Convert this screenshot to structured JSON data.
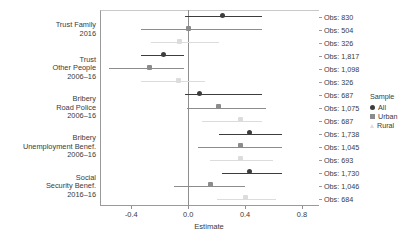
{
  "chart_data": {
    "type": "scatter",
    "title": "",
    "xlabel": "Estimate",
    "ylabel": "",
    "xlim": [
      -0.62,
      0.92
    ],
    "xticks": [
      -0.4,
      0.0,
      0.4,
      0.8
    ],
    "xticklabels": [
      "-0.4",
      "0.0",
      "0.4",
      "0.8"
    ],
    "grid": false,
    "reference_line": 0.0,
    "legend": {
      "title": "Sample",
      "position": "right",
      "entries": [
        {
          "name": "All",
          "color": "#3d3d3d",
          "marker": "circle"
        },
        {
          "name": "Urban",
          "color": "#8c8c8c",
          "marker": "square"
        },
        {
          "name": "Rural",
          "color": "#dcdcdc",
          "marker": "triangle"
        }
      ]
    },
    "obs_label_prefix": "Obs: ",
    "groups": [
      {
        "label": "Trust Family\n2016",
        "rows": [
          {
            "sample": "All",
            "estimate": 0.24,
            "low": -0.02,
            "high": 0.52,
            "obs": "830"
          },
          {
            "sample": "Urban",
            "estimate": 0.0,
            "low": -0.33,
            "high": 0.52,
            "obs": "504"
          },
          {
            "sample": "Rural",
            "estimate": -0.06,
            "low": -0.26,
            "high": 0.22,
            "obs": "326"
          }
        ]
      },
      {
        "label": "Trust\nOther People\n2006–16",
        "rows": [
          {
            "sample": "All",
            "estimate": -0.17,
            "low": -0.33,
            "high": -0.03,
            "obs": "1,817"
          },
          {
            "sample": "Urban",
            "estimate": -0.27,
            "low": -0.56,
            "high": -0.03,
            "obs": "1,098"
          },
          {
            "sample": "Rural",
            "estimate": -0.07,
            "low": -0.33,
            "high": 0.12,
            "obs": "326"
          }
        ]
      },
      {
        "label": "Bribery\nRoad Police\n2006–16",
        "rows": [
          {
            "sample": "All",
            "estimate": 0.08,
            "low": -0.02,
            "high": 0.52,
            "obs": "687"
          },
          {
            "sample": "Urban",
            "estimate": 0.21,
            "low": -0.01,
            "high": 0.55,
            "obs": "1,075"
          },
          {
            "sample": "Rural",
            "estimate": 0.37,
            "low": 0.1,
            "high": 0.52,
            "obs": "687"
          }
        ]
      },
      {
        "label": "Bribery\nUnemployment Benef.\n2006–16",
        "rows": [
          {
            "sample": "All",
            "estimate": 0.43,
            "low": 0.22,
            "high": 0.66,
            "obs": "1,738"
          },
          {
            "sample": "Urban",
            "estimate": 0.37,
            "low": 0.07,
            "high": 0.66,
            "obs": "1,045"
          },
          {
            "sample": "Rural",
            "estimate": 0.37,
            "low": 0.15,
            "high": 0.6,
            "obs": "693"
          }
        ]
      },
      {
        "label": "Social\nSecurity Benef.\n2016–16",
        "rows": [
          {
            "sample": "All",
            "estimate": 0.43,
            "low": 0.24,
            "high": 0.66,
            "obs": "1,730"
          },
          {
            "sample": "Urban",
            "estimate": 0.16,
            "low": -0.1,
            "high": 0.4,
            "obs": "1,046"
          },
          {
            "sample": "Rural",
            "estimate": 0.4,
            "low": 0.2,
            "high": 0.62,
            "obs": "684"
          }
        ]
      }
    ]
  }
}
